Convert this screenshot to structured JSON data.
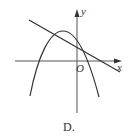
{
  "figure": {
    "caption": "D.",
    "axes": {
      "x_label": "x",
      "y_label": "y",
      "origin_label": "O",
      "origin_px": [
        77,
        61
      ]
    },
    "curves": [
      {
        "type": "parabola",
        "opens": "down",
        "vertex_px": [
          63,
          31
        ],
        "description": "downward-opening parabola with vertex left of y-axis, in second quadrant"
      },
      {
        "type": "line",
        "slope_sign": "negative",
        "description": "decreasing line with positive y-intercept, crossing parabola twice"
      }
    ],
    "stroke_color": "#333333",
    "axis_color": "#555555"
  }
}
